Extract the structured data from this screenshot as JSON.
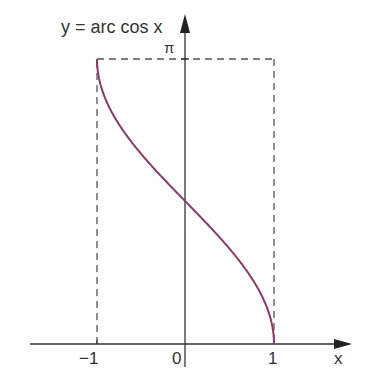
{
  "chart_data": {
    "type": "line",
    "title": "y = arc cos x",
    "xlabel": "x",
    "ylabel": "y",
    "function": "arccos(x)",
    "x_ticks": [
      {
        "value": -1,
        "label": "−1"
      },
      {
        "value": 0,
        "label": "0"
      },
      {
        "value": 1,
        "label": "1"
      }
    ],
    "y_ticks": [
      {
        "value": 3.14159,
        "label": "π"
      }
    ],
    "xlim": [
      -1.75,
      1.9
    ],
    "ylim": [
      -0.25,
      3.6
    ],
    "grid": false,
    "legend": null,
    "series": [
      {
        "name": "y = arc cos x",
        "color": "#8b3a6b",
        "x": [
          -1.0,
          -0.98,
          -0.9,
          -0.8,
          -0.6,
          -0.4,
          -0.2,
          0.0,
          0.2,
          0.4,
          0.6,
          0.8,
          0.9,
          0.98,
          1.0
        ],
        "y": [
          3.1416,
          2.9413,
          2.6906,
          2.4981,
          2.2143,
          1.9823,
          1.7722,
          1.5708,
          1.3694,
          1.1593,
          0.9273,
          0.6435,
          0.451,
          0.2003,
          0.0
        ]
      }
    ],
    "guides": [
      {
        "type": "dashed",
        "from": [
          -1,
          0
        ],
        "to": [
          -1,
          3.14159
        ]
      },
      {
        "type": "dashed",
        "from": [
          -1,
          3.14159
        ],
        "to": [
          1,
          3.14159
        ]
      },
      {
        "type": "dashed",
        "from": [
          1,
          3.14159
        ],
        "to": [
          1,
          0
        ]
      }
    ]
  },
  "labels": {
    "title": "y = arc cos x",
    "pi": "π",
    "x_axis": "x",
    "tick_neg1": "−1",
    "tick_0": "0",
    "tick_1": "1"
  },
  "colors": {
    "curve": "#8b3a6b",
    "axis": "#333333",
    "dash": "#555555"
  }
}
